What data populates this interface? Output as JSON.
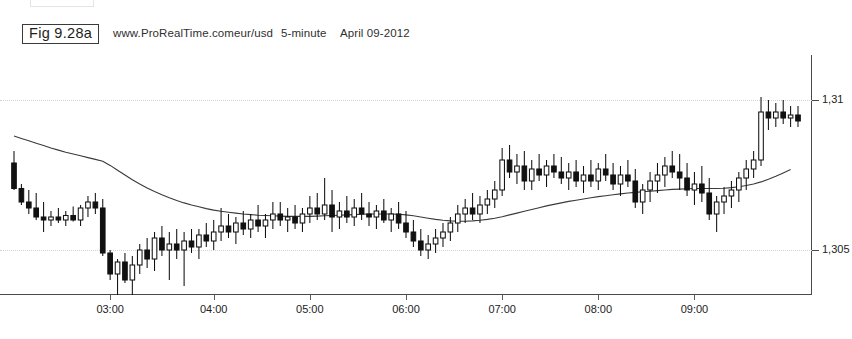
{
  "figure": {
    "label": "Fig 9.28a",
    "source": "www.ProRealTime.com",
    "instrument": "eur/usd",
    "timeframe": "5-minute",
    "date": "April 09-2012",
    "watermark": "© ProRealTime.com"
  },
  "axes": {
    "y_labels": [
      "1,31",
      "1,305"
    ],
    "x_labels": [
      "03:00",
      "04:00",
      "05:00",
      "06:00",
      "07:00",
      "08:00",
      "09:00"
    ]
  },
  "colors": {
    "up_candle": "#ffffff",
    "down_candle": "#111111",
    "outline": "#111111",
    "ma_line": "#3a3a3a",
    "grid": "#d2d2d2",
    "axis": "#4a4a4a"
  },
  "chart_data": {
    "type": "candlestick",
    "title": "eur/usd 5-minute April 09-2012",
    "xlabel": "",
    "ylabel": "",
    "ylim": [
      1.3035,
      1.3115
    ],
    "grid": true,
    "legend": "none",
    "yticks": [
      {
        "label": "1,31",
        "value": 1.31
      },
      {
        "label": "1,305",
        "value": 1.305
      }
    ],
    "xticks": [
      {
        "label": "03:00",
        "index": 13
      },
      {
        "label": "04:00",
        "index": 27
      },
      {
        "label": "05:00",
        "index": 40
      },
      {
        "label": "06:00",
        "index": 53
      },
      {
        "label": "07:00",
        "index": 66
      },
      {
        "label": "08:00",
        "index": 79
      },
      {
        "label": "09:00",
        "index": 92
      }
    ],
    "overlays": [
      {
        "name": "moving-average",
        "type": "line",
        "style": "solid",
        "color": "#3a3a3a"
      }
    ],
    "ohlc": [
      {
        "o": 1.3079,
        "h": 1.3083,
        "l": 1.307,
        "c": 1.30705,
        "dir": "down"
      },
      {
        "o": 1.30705,
        "h": 1.3072,
        "l": 1.3065,
        "c": 1.3066,
        "dir": "down"
      },
      {
        "o": 1.3066,
        "h": 1.307,
        "l": 1.3062,
        "c": 1.3064,
        "dir": "down"
      },
      {
        "o": 1.3064,
        "h": 1.3069,
        "l": 1.306,
        "c": 1.3061,
        "dir": "down"
      },
      {
        "o": 1.3061,
        "h": 1.3066,
        "l": 1.3056,
        "c": 1.306,
        "dir": "down"
      },
      {
        "o": 1.306,
        "h": 1.3063,
        "l": 1.3058,
        "c": 1.3061,
        "dir": "up"
      },
      {
        "o": 1.3061,
        "h": 1.3064,
        "l": 1.3059,
        "c": 1.306,
        "dir": "down"
      },
      {
        "o": 1.306,
        "h": 1.3063,
        "l": 1.3058,
        "c": 1.30615,
        "dir": "up"
      },
      {
        "o": 1.30615,
        "h": 1.30645,
        "l": 1.30595,
        "c": 1.306,
        "dir": "down"
      },
      {
        "o": 1.306,
        "h": 1.3065,
        "l": 1.3058,
        "c": 1.3064,
        "dir": "up"
      },
      {
        "o": 1.3064,
        "h": 1.3068,
        "l": 1.3061,
        "c": 1.3066,
        "dir": "up"
      },
      {
        "o": 1.3066,
        "h": 1.3069,
        "l": 1.3062,
        "c": 1.3064,
        "dir": "down"
      },
      {
        "o": 1.3064,
        "h": 1.3067,
        "l": 1.3048,
        "c": 1.3049,
        "dir": "down"
      },
      {
        "o": 1.3049,
        "h": 1.305,
        "l": 1.304,
        "c": 1.3042,
        "dir": "down"
      },
      {
        "o": 1.3042,
        "h": 1.3047,
        "l": 1.3033,
        "c": 1.3046,
        "dir": "up"
      },
      {
        "o": 1.3046,
        "h": 1.3049,
        "l": 1.3039,
        "c": 1.304,
        "dir": "down"
      },
      {
        "o": 1.304,
        "h": 1.3048,
        "l": 1.303,
        "c": 1.3045,
        "dir": "up"
      },
      {
        "o": 1.3045,
        "h": 1.3052,
        "l": 1.3042,
        "c": 1.305,
        "dir": "up"
      },
      {
        "o": 1.305,
        "h": 1.3054,
        "l": 1.3044,
        "c": 1.3047,
        "dir": "down"
      },
      {
        "o": 1.3047,
        "h": 1.3056,
        "l": 1.3043,
        "c": 1.3054,
        "dir": "up"
      },
      {
        "o": 1.3054,
        "h": 1.3058,
        "l": 1.3048,
        "c": 1.305,
        "dir": "down"
      },
      {
        "o": 1.305,
        "h": 1.3056,
        "l": 1.304,
        "c": 1.3052,
        "dir": "up"
      },
      {
        "o": 1.3052,
        "h": 1.3057,
        "l": 1.3047,
        "c": 1.305,
        "dir": "down"
      },
      {
        "o": 1.305,
        "h": 1.3056,
        "l": 1.3038,
        "c": 1.3053,
        "dir": "up"
      },
      {
        "o": 1.3053,
        "h": 1.3057,
        "l": 1.3049,
        "c": 1.3051,
        "dir": "down"
      },
      {
        "o": 1.3051,
        "h": 1.3057,
        "l": 1.3047,
        "c": 1.3055,
        "dir": "up"
      },
      {
        "o": 1.3055,
        "h": 1.3059,
        "l": 1.3051,
        "c": 1.3053,
        "dir": "down"
      },
      {
        "o": 1.3053,
        "h": 1.306,
        "l": 1.305,
        "c": 1.3056,
        "dir": "up"
      },
      {
        "o": 1.3056,
        "h": 1.3064,
        "l": 1.3053,
        "c": 1.3058,
        "dir": "up"
      },
      {
        "o": 1.3058,
        "h": 1.3062,
        "l": 1.3054,
        "c": 1.3056,
        "dir": "down"
      },
      {
        "o": 1.3056,
        "h": 1.3061,
        "l": 1.3052,
        "c": 1.3059,
        "dir": "up"
      },
      {
        "o": 1.3059,
        "h": 1.3063,
        "l": 1.3055,
        "c": 1.3057,
        "dir": "down"
      },
      {
        "o": 1.3057,
        "h": 1.3062,
        "l": 1.3054,
        "c": 1.306,
        "dir": "up"
      },
      {
        "o": 1.306,
        "h": 1.3065,
        "l": 1.3056,
        "c": 1.3058,
        "dir": "down"
      },
      {
        "o": 1.3058,
        "h": 1.3062,
        "l": 1.3054,
        "c": 1.306,
        "dir": "up"
      },
      {
        "o": 1.306,
        "h": 1.3066,
        "l": 1.3057,
        "c": 1.3062,
        "dir": "up"
      },
      {
        "o": 1.3062,
        "h": 1.3066,
        "l": 1.3058,
        "c": 1.306,
        "dir": "down"
      },
      {
        "o": 1.306,
        "h": 1.3064,
        "l": 1.3056,
        "c": 1.3061,
        "dir": "up"
      },
      {
        "o": 1.3061,
        "h": 1.3065,
        "l": 1.3057,
        "c": 1.3059,
        "dir": "down"
      },
      {
        "o": 1.3059,
        "h": 1.3064,
        "l": 1.3056,
        "c": 1.3062,
        "dir": "up"
      },
      {
        "o": 1.3062,
        "h": 1.3068,
        "l": 1.3059,
        "c": 1.3064,
        "dir": "up"
      },
      {
        "o": 1.3064,
        "h": 1.3069,
        "l": 1.306,
        "c": 1.3062,
        "dir": "down"
      },
      {
        "o": 1.3062,
        "h": 1.3074,
        "l": 1.306,
        "c": 1.3065,
        "dir": "up"
      },
      {
        "o": 1.3065,
        "h": 1.307,
        "l": 1.3056,
        "c": 1.3061,
        "dir": "down"
      },
      {
        "o": 1.3061,
        "h": 1.3066,
        "l": 1.3057,
        "c": 1.3063,
        "dir": "up"
      },
      {
        "o": 1.3063,
        "h": 1.3068,
        "l": 1.3059,
        "c": 1.3061,
        "dir": "down"
      },
      {
        "o": 1.3061,
        "h": 1.3067,
        "l": 1.3058,
        "c": 1.3064,
        "dir": "up"
      },
      {
        "o": 1.3064,
        "h": 1.3069,
        "l": 1.306,
        "c": 1.3062,
        "dir": "down"
      },
      {
        "o": 1.3062,
        "h": 1.3066,
        "l": 1.3058,
        "c": 1.3061,
        "dir": "down"
      },
      {
        "o": 1.3061,
        "h": 1.3065,
        "l": 1.3057,
        "c": 1.3063,
        "dir": "up"
      },
      {
        "o": 1.3063,
        "h": 1.3067,
        "l": 1.3059,
        "c": 1.306,
        "dir": "down"
      },
      {
        "o": 1.306,
        "h": 1.3064,
        "l": 1.3056,
        "c": 1.3062,
        "dir": "up"
      },
      {
        "o": 1.3062,
        "h": 1.3066,
        "l": 1.3057,
        "c": 1.3059,
        "dir": "down"
      },
      {
        "o": 1.3059,
        "h": 1.3063,
        "l": 1.3054,
        "c": 1.3056,
        "dir": "down"
      },
      {
        "o": 1.3056,
        "h": 1.306,
        "l": 1.3051,
        "c": 1.3053,
        "dir": "down"
      },
      {
        "o": 1.3053,
        "h": 1.3057,
        "l": 1.3048,
        "c": 1.305,
        "dir": "down"
      },
      {
        "o": 1.305,
        "h": 1.3055,
        "l": 1.3047,
        "c": 1.3052,
        "dir": "up"
      },
      {
        "o": 1.3052,
        "h": 1.3057,
        "l": 1.3049,
        "c": 1.3054,
        "dir": "up"
      },
      {
        "o": 1.3054,
        "h": 1.3059,
        "l": 1.3051,
        "c": 1.3056,
        "dir": "up"
      },
      {
        "o": 1.3056,
        "h": 1.3061,
        "l": 1.3053,
        "c": 1.3059,
        "dir": "up"
      },
      {
        "o": 1.3059,
        "h": 1.3065,
        "l": 1.3056,
        "c": 1.3062,
        "dir": "up"
      },
      {
        "o": 1.3062,
        "h": 1.3067,
        "l": 1.3059,
        "c": 1.3064,
        "dir": "up"
      },
      {
        "o": 1.3064,
        "h": 1.3069,
        "l": 1.306,
        "c": 1.3062,
        "dir": "down"
      },
      {
        "o": 1.3062,
        "h": 1.3068,
        "l": 1.3059,
        "c": 1.3065,
        "dir": "up"
      },
      {
        "o": 1.3065,
        "h": 1.307,
        "l": 1.3062,
        "c": 1.3067,
        "dir": "up"
      },
      {
        "o": 1.3067,
        "h": 1.3073,
        "l": 1.3064,
        "c": 1.307,
        "dir": "up"
      },
      {
        "o": 1.307,
        "h": 1.3084,
        "l": 1.3068,
        "c": 1.308,
        "dir": "up"
      },
      {
        "o": 1.308,
        "h": 1.3085,
        "l": 1.3074,
        "c": 1.3076,
        "dir": "down"
      },
      {
        "o": 1.3076,
        "h": 1.3082,
        "l": 1.3072,
        "c": 1.3078,
        "dir": "up"
      },
      {
        "o": 1.3078,
        "h": 1.3083,
        "l": 1.307,
        "c": 1.3073,
        "dir": "down"
      },
      {
        "o": 1.3073,
        "h": 1.308,
        "l": 1.307,
        "c": 1.3077,
        "dir": "up"
      },
      {
        "o": 1.3077,
        "h": 1.3082,
        "l": 1.3073,
        "c": 1.3075,
        "dir": "down"
      },
      {
        "o": 1.3075,
        "h": 1.308,
        "l": 1.3071,
        "c": 1.3078,
        "dir": "up"
      },
      {
        "o": 1.3078,
        "h": 1.3082,
        "l": 1.3074,
        "c": 1.3076,
        "dir": "down"
      },
      {
        "o": 1.3076,
        "h": 1.3081,
        "l": 1.3072,
        "c": 1.3074,
        "dir": "down"
      },
      {
        "o": 1.3074,
        "h": 1.3079,
        "l": 1.307,
        "c": 1.3076,
        "dir": "up"
      },
      {
        "o": 1.3076,
        "h": 1.308,
        "l": 1.3071,
        "c": 1.3073,
        "dir": "down"
      },
      {
        "o": 1.3073,
        "h": 1.3078,
        "l": 1.3069,
        "c": 1.3075,
        "dir": "up"
      },
      {
        "o": 1.3075,
        "h": 1.308,
        "l": 1.3071,
        "c": 1.3073,
        "dir": "down"
      },
      {
        "o": 1.3073,
        "h": 1.3079,
        "l": 1.307,
        "c": 1.3077,
        "dir": "up"
      },
      {
        "o": 1.3077,
        "h": 1.3082,
        "l": 1.3073,
        "c": 1.3075,
        "dir": "down"
      },
      {
        "o": 1.3075,
        "h": 1.3079,
        "l": 1.307,
        "c": 1.3072,
        "dir": "down"
      },
      {
        "o": 1.3072,
        "h": 1.3078,
        "l": 1.3068,
        "c": 1.3075,
        "dir": "up"
      },
      {
        "o": 1.3075,
        "h": 1.308,
        "l": 1.3071,
        "c": 1.3073,
        "dir": "down"
      },
      {
        "o": 1.3073,
        "h": 1.3077,
        "l": 1.3064,
        "c": 1.3066,
        "dir": "down"
      },
      {
        "o": 1.3066,
        "h": 1.3072,
        "l": 1.3062,
        "c": 1.307,
        "dir": "up"
      },
      {
        "o": 1.307,
        "h": 1.3076,
        "l": 1.3066,
        "c": 1.3073,
        "dir": "up"
      },
      {
        "o": 1.3073,
        "h": 1.3079,
        "l": 1.3069,
        "c": 1.3075,
        "dir": "up"
      },
      {
        "o": 1.3075,
        "h": 1.3081,
        "l": 1.3071,
        "c": 1.3078,
        "dir": "up"
      },
      {
        "o": 1.3078,
        "h": 1.3083,
        "l": 1.3074,
        "c": 1.3076,
        "dir": "down"
      },
      {
        "o": 1.3076,
        "h": 1.3082,
        "l": 1.307,
        "c": 1.3074,
        "dir": "down"
      },
      {
        "o": 1.3074,
        "h": 1.3079,
        "l": 1.3068,
        "c": 1.307,
        "dir": "down"
      },
      {
        "o": 1.307,
        "h": 1.3076,
        "l": 1.3065,
        "c": 1.3072,
        "dir": "up"
      },
      {
        "o": 1.3072,
        "h": 1.3078,
        "l": 1.3066,
        "c": 1.3069,
        "dir": "down"
      },
      {
        "o": 1.3069,
        "h": 1.3074,
        "l": 1.306,
        "c": 1.3062,
        "dir": "down"
      },
      {
        "o": 1.3062,
        "h": 1.3068,
        "l": 1.3056,
        "c": 1.3066,
        "dir": "up"
      },
      {
        "o": 1.3066,
        "h": 1.3071,
        "l": 1.3062,
        "c": 1.3068,
        "dir": "up"
      },
      {
        "o": 1.3068,
        "h": 1.3073,
        "l": 1.3064,
        "c": 1.307,
        "dir": "up"
      },
      {
        "o": 1.307,
        "h": 1.3076,
        "l": 1.3066,
        "c": 1.3074,
        "dir": "up"
      },
      {
        "o": 1.3074,
        "h": 1.308,
        "l": 1.307,
        "c": 1.3077,
        "dir": "up"
      },
      {
        "o": 1.3077,
        "h": 1.3083,
        "l": 1.3074,
        "c": 1.308,
        "dir": "up"
      },
      {
        "o": 1.308,
        "h": 1.3101,
        "l": 1.3078,
        "c": 1.3096,
        "dir": "up"
      },
      {
        "o": 1.3096,
        "h": 1.31,
        "l": 1.309,
        "c": 1.3094,
        "dir": "down"
      },
      {
        "o": 1.3094,
        "h": 1.3099,
        "l": 1.3091,
        "c": 1.3096,
        "dir": "up"
      },
      {
        "o": 1.3096,
        "h": 1.31,
        "l": 1.3092,
        "c": 1.3094,
        "dir": "down"
      },
      {
        "o": 1.3094,
        "h": 1.3098,
        "l": 1.3091,
        "c": 1.3095,
        "dir": "up"
      },
      {
        "o": 1.3095,
        "h": 1.3098,
        "l": 1.3091,
        "c": 1.3093,
        "dir": "down"
      }
    ],
    "ma_values": [
      1.3088,
      1.30872,
      1.30864,
      1.30856,
      1.30848,
      1.3084,
      1.30833,
      1.30826,
      1.3082,
      1.30814,
      1.30808,
      1.30802,
      1.30796,
      1.30782,
      1.30766,
      1.3075,
      1.30734,
      1.3072,
      1.30707,
      1.30695,
      1.30684,
      1.30674,
      1.30665,
      1.30657,
      1.3065,
      1.30644,
      1.30638,
      1.30633,
      1.30629,
      1.30626,
      1.30623,
      1.3062,
      1.30618,
      1.30616,
      1.30615,
      1.30614,
      1.30613,
      1.30612,
      1.30612,
      1.30612,
      1.30612,
      1.30613,
      1.30614,
      1.30615,
      1.30616,
      1.30617,
      1.30618,
      1.30619,
      1.3062,
      1.3062,
      1.3062,
      1.3062,
      1.30619,
      1.30617,
      1.30614,
      1.3061,
      1.30606,
      1.30602,
      1.30599,
      1.30597,
      1.30596,
      1.30596,
      1.30597,
      1.30599,
      1.30602,
      1.30606,
      1.30611,
      1.30617,
      1.30623,
      1.30629,
      1.30635,
      1.30641,
      1.30647,
      1.30652,
      1.30657,
      1.30662,
      1.30666,
      1.3067,
      1.30674,
      1.30678,
      1.30681,
      1.30684,
      1.30687,
      1.3069,
      1.30692,
      1.30694,
      1.30696,
      1.30698,
      1.307,
      1.30702,
      1.30703,
      1.30704,
      1.30705,
      1.30705,
      1.30705,
      1.30705,
      1.30706,
      1.30708,
      1.30711,
      1.30715,
      1.3072,
      1.30727,
      1.30736,
      1.30746,
      1.30757,
      1.30768
    ]
  }
}
